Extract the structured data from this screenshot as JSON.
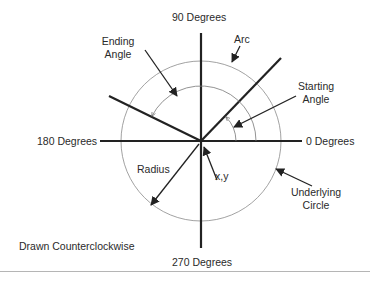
{
  "diagram": {
    "title_hint": "Arc drawn counterclockwise",
    "labels": {
      "deg90": "90 Degrees",
      "deg0": "0 Degrees",
      "deg180": "180 Degrees",
      "deg270": "270 Degrees",
      "ending_angle_1": "Ending",
      "ending_angle_2": "Angle",
      "arc": "Arc",
      "starting_angle_1": "Starting",
      "starting_angle_2": "Angle",
      "radius": "Radius",
      "xy": "x,y",
      "underlying_1": "Underlying",
      "underlying_2": "Circle",
      "direction": "Drawn Counterclockwise"
    },
    "geometry": {
      "center": [
        201,
        141
      ],
      "outer_radius": 80,
      "ending_arc_radius": 55,
      "starting_arc_radius": 35,
      "start_angle_deg": 45,
      "end_angle_deg": 154
    },
    "colors": {
      "axis": "#222222",
      "circle": "#888888",
      "text": "#2a2a2a"
    }
  }
}
